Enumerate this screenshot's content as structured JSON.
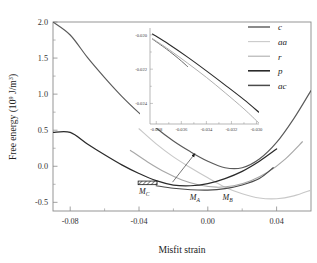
{
  "figure": {
    "background": "#ffffff"
  },
  "chart_data": {
    "type": "line",
    "title": "",
    "xlabel": "Misfit strain",
    "ylabel": "Free energy (10⁹ J/m³)",
    "ylabel_prefix": "Free energy (10",
    "ylabel_exp": "9",
    "ylabel_suffix": " J/m",
    "ylabel_exp2": "3",
    "ylabel_close": ")",
    "xlim": [
      -0.09,
      0.06
    ],
    "ylim": [
      -0.62,
      2.0
    ],
    "grid": false,
    "legend_position": "top-right",
    "xticks": [
      -0.08,
      -0.04,
      0.0,
      0.04
    ],
    "xticklabels": [
      "-0.08",
      "-0.04",
      "0.00",
      "0.04"
    ],
    "yticks": [
      -0.5,
      0.0,
      0.5,
      1.0,
      1.5,
      2.0
    ],
    "yticklabels": [
      "-0.5",
      "0.0",
      "0.5",
      "1.0",
      "1.5",
      "2.0"
    ],
    "xminorticks": [
      -0.06,
      -0.02,
      0.02
    ],
    "yminorticks": [
      -0.25,
      0.25,
      0.75,
      1.25,
      1.75
    ],
    "series": [
      {
        "name": "c",
        "label": "c",
        "color": "#5a5a5a",
        "width": 1.15,
        "x": [
          -0.09,
          -0.08,
          -0.07,
          -0.06,
          -0.05,
          -0.04,
          -0.03,
          -0.02,
          -0.01,
          0.0,
          0.01,
          0.02,
          0.03,
          0.04,
          0.05,
          0.06
        ],
        "y": [
          2.0,
          1.82,
          1.51,
          1.23,
          0.97,
          0.74,
          0.53,
          0.35,
          0.2,
          0.07,
          -0.02,
          -0.02,
          0.1,
          0.33,
          0.66,
          1.05
        ]
      },
      {
        "name": "aa",
        "label": "aa",
        "color": "#c8c8c8",
        "width": 1.15,
        "x": [
          -0.04,
          -0.03,
          -0.02,
          -0.01,
          0.0,
          0.01,
          0.02,
          0.03,
          0.04,
          0.05,
          0.06
        ],
        "y": [
          0.52,
          0.31,
          0.13,
          -0.02,
          -0.16,
          -0.29,
          -0.38,
          -0.44,
          -0.45,
          -0.41,
          -0.33
        ]
      },
      {
        "name": "r",
        "label": "r",
        "color": "#a8a8a8",
        "width": 1.15,
        "x": [
          -0.045,
          -0.035,
          -0.025,
          -0.015,
          -0.005,
          0.005,
          0.015,
          0.025,
          0.035,
          0.045,
          0.055
        ],
        "y": [
          0.22,
          0.06,
          -0.08,
          -0.19,
          -0.26,
          -0.29,
          -0.27,
          -0.2,
          -0.08,
          0.1,
          0.34
        ]
      },
      {
        "name": "p",
        "label": "p",
        "color": "#2a2a2a",
        "width": 1.25,
        "x": [
          -0.09,
          -0.08,
          -0.07,
          -0.06,
          -0.05,
          -0.04,
          -0.03,
          -0.02,
          -0.01,
          0.0,
          0.01,
          0.02,
          0.03,
          0.04
        ],
        "y": [
          0.47,
          0.47,
          0.31,
          0.16,
          0.02,
          -0.1,
          -0.2,
          -0.26,
          -0.27,
          -0.24,
          -0.17,
          -0.07,
          0.07,
          0.24
        ]
      },
      {
        "name": "ac",
        "label": "ac",
        "color": "#4a4a4a",
        "width": 1.15,
        "x": [
          -0.03,
          -0.02,
          -0.01,
          0.0,
          0.01,
          0.02,
          0.03,
          0.038
        ],
        "y": [
          -0.27,
          -0.305,
          -0.325,
          -0.33,
          -0.31,
          -0.26,
          -0.17,
          -0.02
        ]
      }
    ],
    "annotations": [
      {
        "name": "M_C",
        "base": "M",
        "sub": "C",
        "x": -0.037,
        "y": -0.38
      },
      {
        "name": "M_A",
        "base": "M",
        "sub": "A",
        "x": -0.0075,
        "y": -0.465
      },
      {
        "name": "M_B",
        "base": "M",
        "sub": "B",
        "x": 0.0115,
        "y": -0.465
      }
    ],
    "hatched_region": {
      "name": "hatched-box",
      "x0": -0.0405,
      "x1": -0.0295,
      "y0": -0.255,
      "y1": -0.205
    },
    "arrow": {
      "name": "inset-pointer-arrow",
      "from_x": -0.0205,
      "from_y": -0.22,
      "to_x": -0.0075,
      "to_y": 0.175
    },
    "inset": {
      "type": "line",
      "xlim": [
        -0.0385,
        -0.0298
      ],
      "ylim": [
        -0.0252,
        -0.0196
      ],
      "xticks": [
        -0.038,
        -0.036,
        -0.034,
        -0.032,
        -0.03
      ],
      "xticklabels": [
        "-0.038",
        "-0.036",
        "-0.034",
        "-0.032",
        "-0.030"
      ],
      "yticks": [
        -0.024,
        -0.022,
        -0.02
      ],
      "yticklabels": [
        "-0.024",
        "-0.022",
        "-0.020"
      ],
      "series": [
        {
          "name": "p",
          "color": "#2a2a2a",
          "width": 1.1,
          "x": [
            -0.0383,
            -0.037,
            -0.0355,
            -0.034,
            -0.0325,
            -0.031,
            -0.0298
          ],
          "y": [
            -0.01995,
            -0.02055,
            -0.0213,
            -0.0221,
            -0.02293,
            -0.02378,
            -0.02452
          ]
        },
        {
          "name": "c",
          "color": "#6a6a6a",
          "width": 1.0,
          "x": [
            -0.0383,
            -0.0372,
            -0.0362,
            -0.0355
          ],
          "y": [
            -0.02025,
            -0.02082,
            -0.0214,
            -0.02185
          ]
        },
        {
          "name": "ac",
          "color": "#b0b0b0",
          "width": 1.0,
          "x": [
            -0.0383,
            -0.037,
            -0.0355,
            -0.034,
            -0.0325,
            -0.031,
            -0.0298
          ],
          "y": [
            -0.02022,
            -0.02085,
            -0.02165,
            -0.02248,
            -0.02338,
            -0.02432,
            -0.02515
          ]
        }
      ]
    }
  },
  "legend": {
    "items": [
      {
        "label": "c",
        "color": "#5a5a5a",
        "width": 1.4
      },
      {
        "label": "aa",
        "color": "#cacaca",
        "width": 1.1
      },
      {
        "label": "r",
        "color": "#aeaeae",
        "width": 1.1
      },
      {
        "label": "p",
        "color": "#2a2a2a",
        "width": 1.6
      },
      {
        "label": "ac",
        "color": "#4a4a4a",
        "width": 1.5
      }
    ]
  }
}
